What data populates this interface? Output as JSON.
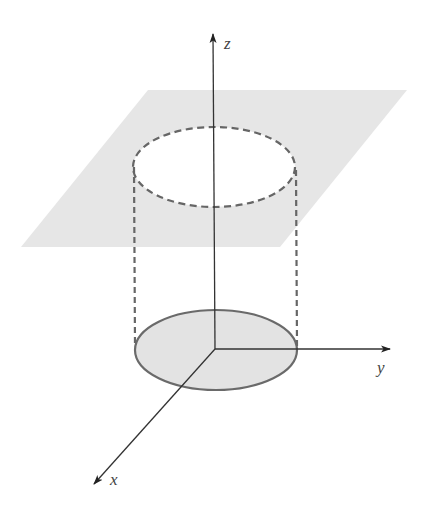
{
  "figure": {
    "colors": {
      "plane_fill": "#e6e6e6",
      "disk_fill": "#e3e3e3",
      "ellipse_stroke": "#6a6a6a",
      "dashed_stroke": "#666666",
      "axis_stroke": "#333333",
      "label_color": "#444444"
    },
    "axes": {
      "origin": [
        215,
        349
      ],
      "z": {
        "label": "z",
        "tip": [
          213,
          34
        ],
        "label_pos": [
          224,
          49
        ]
      },
      "y": {
        "label": "y",
        "tip": [
          390,
          349
        ],
        "label_pos": [
          377,
          372
        ]
      },
      "x": {
        "label": "x",
        "tip": [
          94,
          484
        ],
        "label_pos": [
          110,
          484
        ]
      }
    },
    "plane": {
      "corners": [
        [
          148,
          90
        ],
        [
          407,
          90
        ],
        [
          280,
          247
        ],
        [
          21,
          247
        ]
      ]
    },
    "top_ellipse": {
      "cx": 214,
      "cy": 167,
      "rx": 81,
      "ry": 40,
      "style": "dashed"
    },
    "base_disk": {
      "cx": 216,
      "cy": 350,
      "rx": 81,
      "ry": 40,
      "style": "solid-filled"
    },
    "cylinder_sides": {
      "left_x": 134,
      "right_x": 296,
      "top_y": 167,
      "bottom_y": 350,
      "style": "dashed"
    }
  }
}
